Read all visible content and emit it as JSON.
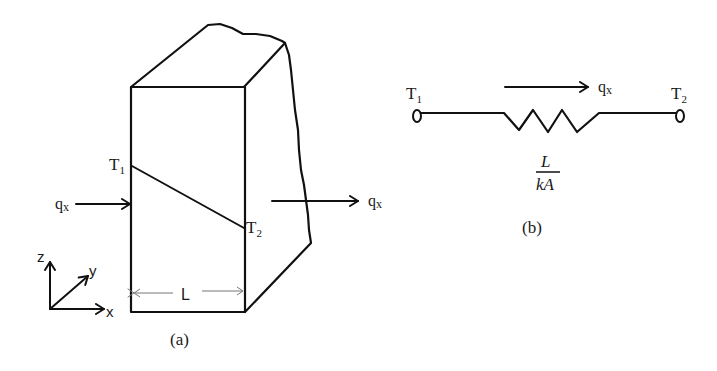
{
  "figure_a": {
    "caption": "(a)",
    "labels": {
      "t1": "T",
      "t1_sub": "1",
      "t2": "T",
      "t2_sub": "2",
      "qx_in": "q",
      "qx_in_sub": "x",
      "qx_out": "q",
      "qx_out_sub": "x",
      "length": "L"
    },
    "axes": {
      "x": "x",
      "y": "y",
      "z": "z"
    }
  },
  "figure_b": {
    "caption": "(b)",
    "labels": {
      "t1": "T",
      "t1_sub": "1",
      "t2": "T",
      "t2_sub": "2",
      "qx": "q",
      "qx_sub": "x",
      "resistance_numerator": "L",
      "resistance_denominator": "kA"
    }
  },
  "colors": {
    "line": "#111111",
    "background": "#ffffff"
  }
}
